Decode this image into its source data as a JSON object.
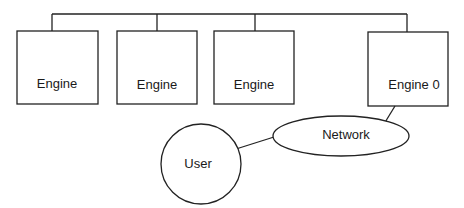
{
  "diagram": {
    "nodes": {
      "engine1": {
        "label": "Engine",
        "shape": "rectangle"
      },
      "engine2": {
        "label": "Engine",
        "shape": "rectangle"
      },
      "engine3": {
        "label": "Engine",
        "shape": "rectangle"
      },
      "engine0": {
        "label": "Engine 0",
        "shape": "rectangle"
      },
      "network": {
        "label": "Network",
        "shape": "ellipse"
      },
      "user": {
        "label": "User",
        "shape": "circle"
      }
    },
    "edges": [
      {
        "from": "bus",
        "to": "engine1"
      },
      {
        "from": "bus",
        "to": "engine2"
      },
      {
        "from": "bus",
        "to": "engine3"
      },
      {
        "from": "bus",
        "to": "engine0"
      },
      {
        "from": "engine0",
        "to": "network"
      },
      {
        "from": "user",
        "to": "network"
      }
    ],
    "colors": {
      "stroke": "#222222",
      "background": "#ffffff",
      "text": "#1a1a1a"
    }
  }
}
